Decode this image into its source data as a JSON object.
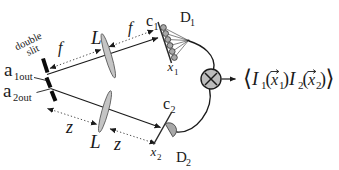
{
  "figure": {
    "type": "optics-correlation-diagram",
    "labels": {
      "double_slit": {
        "line1": "double",
        "line2": "slit"
      },
      "mode1": {
        "main": "a",
        "sub": "1out"
      },
      "mode2": {
        "main": "a",
        "sub": "2out"
      },
      "focal_left": "f",
      "focal_right": "f",
      "lens_top": "L",
      "lens_bottom": "L",
      "dist_left": "z",
      "dist_right": "z",
      "screen1": {
        "main": "c",
        "sub": "1"
      },
      "screen2": {
        "main": "c",
        "sub": "2"
      },
      "coord1": {
        "main": "x",
        "sub": "1"
      },
      "coord2": {
        "main": "x",
        "sub": "2"
      },
      "detector1": {
        "main": "D",
        "sub": "1"
      },
      "detector2": {
        "main": "D",
        "sub": "2"
      }
    },
    "formula": {
      "lbracket": "⟨",
      "I": "I",
      "sub1": "1",
      "sub2": "2",
      "lparen": "(",
      "rparen": ")",
      "x": "x",
      "rbracket": "⟩"
    },
    "colors": {
      "ink": "#1a1a1a",
      "lens_fill": "#c4c4c4",
      "detector_fill": "#a8a8a8",
      "correlator_fill": "#bcbcbc",
      "background": "#ffffff"
    }
  }
}
